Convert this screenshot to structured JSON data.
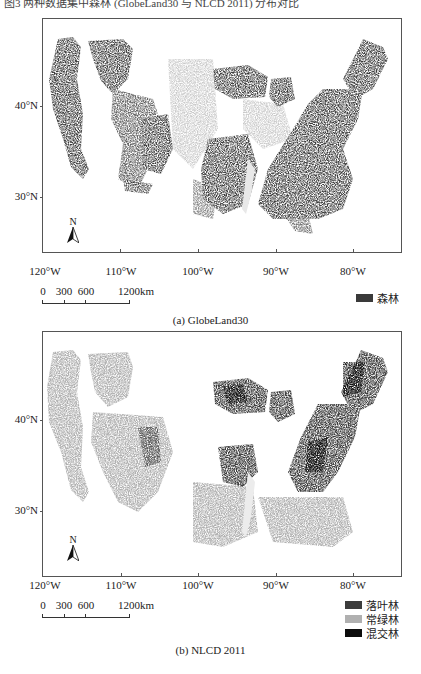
{
  "header": {
    "truncated_text": "图3 两种数据集中森林 (GlobeLand30 与 NLCD 2011) 分布对比"
  },
  "maps": [
    {
      "id": "a",
      "caption": "(a) GlobeLand30",
      "lat_labels": [
        "40°N",
        "30°N"
      ],
      "lon_labels": [
        "120°W",
        "110°W",
        "100°W",
        "90°W",
        "80°W"
      ],
      "north_label": "N",
      "scale": {
        "labels": [
          "0",
          "300",
          "600",
          "1200km"
        ]
      },
      "legend": [
        {
          "label": "森林",
          "color": "#3a3a3a"
        }
      ]
    },
    {
      "id": "b",
      "caption": "(b) NLCD 2011",
      "lat_labels": [
        "40°N",
        "30°N"
      ],
      "lon_labels": [
        "120°W",
        "110°W",
        "100°W",
        "90°W",
        "80°W"
      ],
      "north_label": "N",
      "scale": {
        "labels": [
          "0",
          "300",
          "600",
          "1200km"
        ]
      },
      "legend": [
        {
          "label": "落叶林",
          "color": "#3c3c3c"
        },
        {
          "label": "常绿林",
          "color": "#b0b0b0"
        },
        {
          "label": "混交林",
          "color": "#0c0c0c"
        }
      ]
    }
  ],
  "colors": {
    "frame": "#555555",
    "forest": "#3a3a3a",
    "deciduous": "#3c3c3c",
    "evergreen": "#b0b0b0",
    "mixed": "#0c0c0c"
  }
}
